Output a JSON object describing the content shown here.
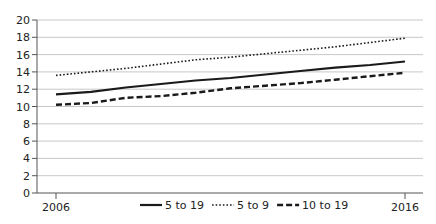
{
  "chart_data": {
    "type": "line",
    "title": "",
    "xlabel": "",
    "ylabel": "",
    "x": [
      2006,
      2007,
      2008,
      2009,
      2010,
      2011,
      2012,
      2013,
      2014,
      2015,
      2016
    ],
    "x_tick_labels": [
      "2006",
      "2016"
    ],
    "ylim": [
      0,
      20
    ],
    "y_ticks": [
      0,
      2,
      4,
      6,
      8,
      10,
      12,
      14,
      16,
      18,
      20
    ],
    "grid": "horizontal",
    "legend_position": "bottom",
    "series": [
      {
        "name": "5 to 19",
        "style": "solid",
        "values": [
          11.4,
          11.7,
          12.2,
          12.6,
          13.0,
          13.3,
          13.7,
          14.1,
          14.5,
          14.8,
          15.2
        ]
      },
      {
        "name": "5 to 9",
        "style": "dotted",
        "values": [
          13.6,
          14.0,
          14.4,
          14.9,
          15.4,
          15.7,
          16.1,
          16.5,
          16.9,
          17.4,
          17.9
        ]
      },
      {
        "name": "10 to 19",
        "style": "dashed",
        "values": [
          10.2,
          10.4,
          11.0,
          11.2,
          11.6,
          12.1,
          12.4,
          12.7,
          13.1,
          13.5,
          13.9
        ]
      }
    ]
  },
  "colors": {
    "line": "#1a1a1a",
    "grid": "#c8c8c8",
    "axis": "#555555",
    "text": "#222222"
  }
}
